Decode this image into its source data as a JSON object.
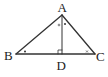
{
  "diagram": {
    "type": "triangle-with-altitude",
    "points": {
      "A": {
        "label": "A",
        "x": 62,
        "y": 15
      },
      "B": {
        "label": "B",
        "x": 16,
        "y": 54
      },
      "C": {
        "label": "C",
        "x": 95,
        "y": 54
      },
      "D": {
        "label": "D",
        "x": 62,
        "y": 54
      }
    },
    "segments": [
      "AB",
      "AC",
      "BC",
      "AD"
    ],
    "right_angle_at": "D",
    "angle_marks": [
      {
        "vertex": "B",
        "mark": "dot"
      },
      {
        "vertex": "A",
        "side": "left of AD",
        "mark": "circle"
      },
      {
        "vertex": "A",
        "side": "right of AD",
        "mark": "dot"
      },
      {
        "vertex": "C",
        "mark": "x"
      }
    ],
    "stroke_color": "#333333"
  }
}
